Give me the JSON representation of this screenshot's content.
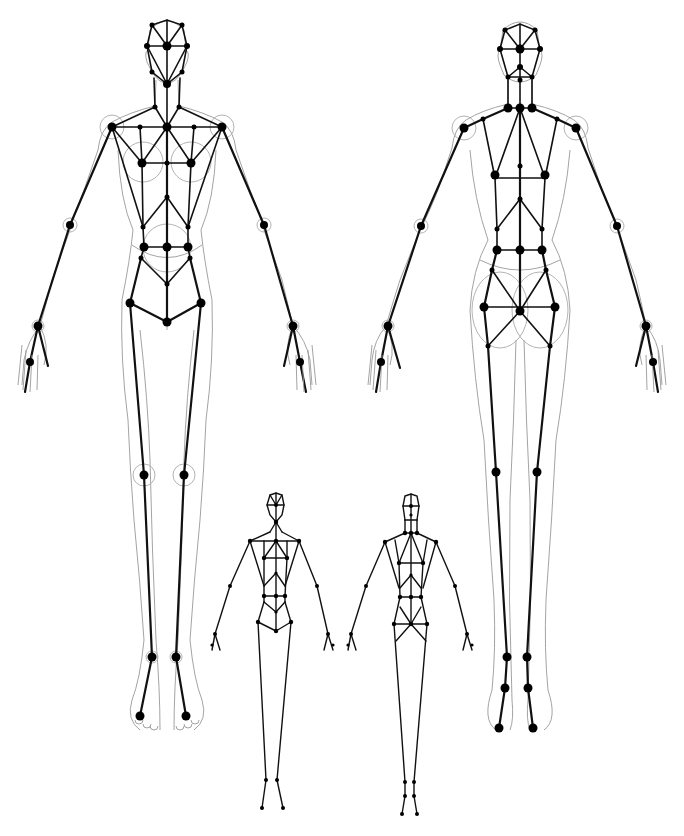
{
  "diagram": {
    "title": "Human figure skeleton joint diagram",
    "colors": {
      "bone": "#111111",
      "joint": "#000000",
      "outline": "#999999",
      "background": "#ffffff"
    },
    "figures": [
      {
        "id": "large-front",
        "label": "Front view (large)",
        "view": "front",
        "size": "large"
      },
      {
        "id": "large-back",
        "label": "Back view (large)",
        "view": "back",
        "size": "large"
      },
      {
        "id": "small-front",
        "label": "Front view (small)",
        "view": "front",
        "size": "small"
      },
      {
        "id": "small-back",
        "label": "Back view (small)",
        "view": "back",
        "size": "small"
      }
    ]
  }
}
